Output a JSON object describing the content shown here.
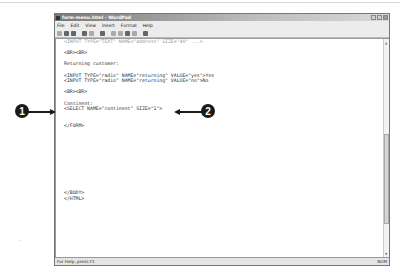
{
  "window": {
    "title": "form-menu.html - WordPad",
    "menu": [
      "File",
      "Edit",
      "View",
      "Insert",
      "Format",
      "Help"
    ],
    "toolbar_icons": [
      "new-icon",
      "open-icon",
      "save-icon",
      "print-icon",
      "print-preview-icon",
      "find-icon",
      "cut-icon",
      "copy-icon",
      "paste-icon",
      "undo-icon",
      "date-time-icon"
    ],
    "controls": [
      "minimize",
      "maximize",
      "close"
    ]
  },
  "editor": {
    "lines": [
      "<INPUT TYPE=\"TEXT\" NAME=\"address\" SIZE=\"40\" ...>",
      "",
      "<BR><BR>",
      "",
      "Returning customer:",
      "",
      "<INPUT TYPE=\"radio\" NAME=\"returning\" VALUE=\"yes\">Yes",
      "<INPUT TYPE=\"radio\" NAME=\"returning\" VALUE=\"no\">No",
      "",
      "<BR><BR>",
      "",
      "Continent:",
      "<SELECT NAME=\"continent\" SIZE=\"1\">",
      "",
      "",
      "</FORM>",
      "",
      "",
      "",
      "",
      "",
      "",
      "",
      "",
      "",
      "",
      "",
      "</BODY>",
      "</HTML>"
    ]
  },
  "status": {
    "help_text": "For Help, press F1",
    "num_indicator": "NUM"
  },
  "callouts": [
    {
      "label": "1",
      "points_to": "SELECT line start"
    },
    {
      "label": "2",
      "points_to": "SIZE=\"1\" attribute"
    }
  ]
}
